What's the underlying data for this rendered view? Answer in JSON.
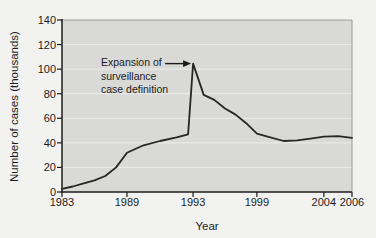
{
  "figure": {
    "background": "#f2f3f1"
  },
  "chart_data": {
    "type": "line",
    "title": "",
    "xlabel": "Year",
    "ylabel": "Number of cases (thousands)",
    "ylim": [
      0,
      140
    ],
    "y_ticks": [
      0,
      20,
      40,
      60,
      80,
      100,
      120,
      140
    ],
    "x_ticks": [
      {
        "label": "1983",
        "year": 1983,
        "frac": 0.0
      },
      {
        "label": "1989",
        "year": 1989,
        "frac": 0.224
      },
      {
        "label": "1993",
        "year": 1993,
        "frac": 0.452
      },
      {
        "label": "1999",
        "year": 1999,
        "frac": 0.672
      },
      {
        "label": "2004",
        "year": 2004,
        "frac": 0.903
      },
      {
        "label": "2006",
        "year": 2006,
        "frac": 1.0
      }
    ],
    "grid": "horizontal-light",
    "legend": "none",
    "series": [
      {
        "name": "Number of cases reported",
        "color": "#262626",
        "points": [
          [
            1983,
            2.5
          ],
          [
            1984,
            4.5
          ],
          [
            1985,
            7
          ],
          [
            1986,
            9.5
          ],
          [
            1987,
            13
          ],
          [
            1988,
            20
          ],
          [
            1989,
            32
          ],
          [
            1990,
            38
          ],
          [
            1991,
            41.5
          ],
          [
            1992,
            44.5
          ],
          [
            1992.7,
            47
          ],
          [
            1993,
            104.5
          ],
          [
            1994,
            79
          ],
          [
            1995,
            75
          ],
          [
            1996,
            68
          ],
          [
            1997,
            63
          ],
          [
            1998,
            56
          ],
          [
            1999,
            47.5
          ],
          [
            2000,
            44.5
          ],
          [
            2001,
            41.5
          ],
          [
            2002,
            42
          ],
          [
            2003,
            43.5
          ],
          [
            2004,
            45
          ],
          [
            2005,
            45.5
          ],
          [
            2006,
            44
          ]
        ]
      }
    ],
    "annotation": {
      "lines": [
        "Expansion of",
        "surveillance",
        "case definition"
      ],
      "target_year": 1993,
      "target_value": 104.5
    },
    "colors": {
      "plot_bg": "#d9dad8",
      "grid": "#ececea",
      "axis": "#1c1c1c",
      "frame": "#9a9b9a",
      "line": "#262626",
      "text": "#1c1c1c"
    }
  }
}
